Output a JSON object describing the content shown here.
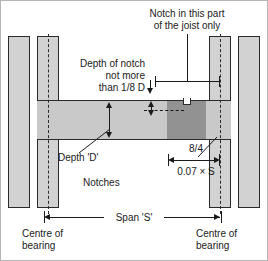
{
  "diagram": {
    "type": "construction-detail",
    "colors": {
      "wall_fill": "#d2d2d2",
      "joist_fill": "#c9c9c9",
      "joist_notch_zone_fill": "#929292",
      "outline": "#2a2a2a",
      "background": "#ffffff"
    },
    "annotations": {
      "notch_zone_note": "Notch in this part\nof the joist only",
      "notch_zone_note_line1": "Notch in this part",
      "notch_zone_note_line2": "of the joist only",
      "notch_depth_note": "Depth of notch\nnot more\nthan 1/8 D",
      "notch_depth_line1": "Depth of notch",
      "notch_depth_line2": "not more",
      "notch_depth_line3": "than 1/8 D",
      "depth_label": "Depth 'D'",
      "notches_label": "Notches",
      "zone_fraction": "8/4",
      "zone_formula": "0.07 × S",
      "span_label": "Span 'S'",
      "bearing_left_line1": "Centre of",
      "bearing_left_line2": "bearing",
      "bearing_right_line1": "Centre of",
      "bearing_right_line2": "bearing"
    },
    "dimensions": [
      {
        "name": "span",
        "label": "Span 'S'",
        "from": "centre-of-bearing-left",
        "to": "centre-of-bearing-right",
        "style": "double-arrow"
      },
      {
        "name": "notch-zone-width",
        "label": "0.07 × S",
        "secondary_label": "8/4",
        "style": "double-arrow"
      },
      {
        "name": "notch-depth",
        "label": "than 1/8 D",
        "style": "single-arrow-down"
      },
      {
        "name": "joist-depth",
        "label": "Depth 'D'",
        "style": "double-arrow-vertical"
      },
      {
        "name": "permitted-notch-region",
        "label": "Notch in this part of the joist only",
        "style": "extent-bar"
      }
    ]
  }
}
